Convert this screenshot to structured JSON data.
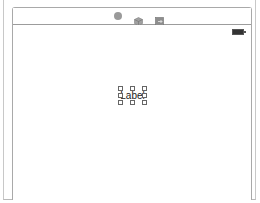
{
  "scene": {
    "dock": {
      "icons": [
        {
          "name": "view-controller-icon"
        },
        {
          "name": "first-responder-icon"
        },
        {
          "name": "exit-icon"
        }
      ]
    },
    "status_bar": {
      "battery": "battery-icon"
    },
    "selected_element": {
      "type": "UILabel",
      "text": "Label"
    }
  }
}
